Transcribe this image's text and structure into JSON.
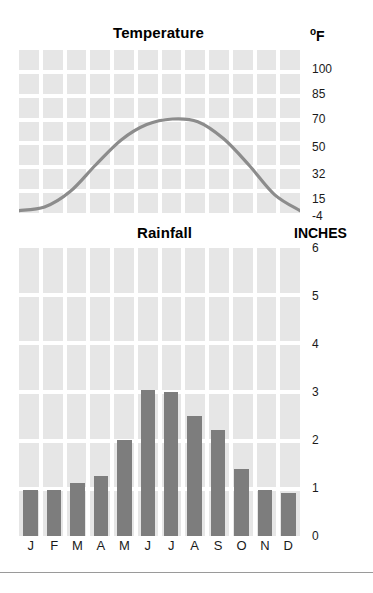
{
  "charts": {
    "temperature": {
      "title": "Temperature",
      "unit_label": "F",
      "unit_degree": "o",
      "tick_labels": [
        "100",
        "85",
        "70",
        "50",
        "32",
        "15",
        "-4"
      ]
    },
    "rainfall": {
      "title": "Rainfall",
      "unit_label": "INCHES",
      "tick_labels": [
        "6",
        "5",
        "4",
        "3",
        "2",
        "1",
        "0"
      ]
    },
    "months": [
      "J",
      "F",
      "M",
      "A",
      "M",
      "J",
      "J",
      "A",
      "S",
      "O",
      "N",
      "D"
    ]
  },
  "chart_data": [
    {
      "type": "line",
      "title": "Temperature",
      "xlabel": "",
      "ylabel": "F",
      "categories": [
        "J",
        "F",
        "M",
        "A",
        "M",
        "J",
        "J",
        "A",
        "S",
        "O",
        "N",
        "D"
      ],
      "values": [
        2,
        6,
        20,
        38,
        55,
        66,
        70,
        68,
        56,
        38,
        18,
        2
      ],
      "ytick_values": [
        100,
        85,
        70,
        50,
        32,
        15,
        -4
      ],
      "ytick_labels": [
        "100",
        "85",
        "70",
        "50",
        "32",
        "15",
        "-4"
      ],
      "ylim": [
        -4,
        110
      ],
      "grid": true,
      "legend": "none",
      "series_color": "#8c8c8c",
      "note": "Smooth bell-shaped annual temperature curve peaking mid-summer near 70 F and bottoming near -4 F in winter."
    },
    {
      "type": "bar",
      "title": "Rainfall",
      "xlabel": "",
      "ylabel": "INCHES",
      "categories": [
        "J",
        "F",
        "M",
        "A",
        "M",
        "J",
        "J",
        "A",
        "S",
        "O",
        "N",
        "D"
      ],
      "values": [
        0.95,
        0.95,
        1.1,
        1.25,
        2.0,
        3.05,
        3.0,
        2.5,
        2.2,
        1.4,
        0.95,
        0.9
      ],
      "ytick_values": [
        6,
        5,
        4,
        3,
        2,
        1,
        0
      ],
      "ytick_labels": [
        "6",
        "5",
        "4",
        "3",
        "2",
        "1",
        "0"
      ],
      "ylim": [
        0,
        6
      ],
      "grid": true,
      "legend": "none",
      "bar_color": "#7d7d7d"
    }
  ],
  "colors": {
    "grid_cell": "#e6e6e6",
    "bar": "#7d7d7d",
    "line": "#8c8c8c",
    "text": "#1a1a1a",
    "rule": "#9a9a9a"
  }
}
